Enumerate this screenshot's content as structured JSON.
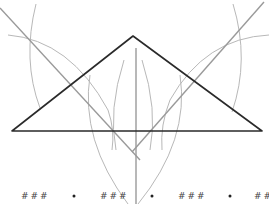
{
  "diagram": {
    "title": "",
    "triangle": {
      "vertices": [
        {
          "name": "A",
          "label": ""
        },
        {
          "name": "B",
          "label": ""
        },
        {
          "name": "C",
          "label": ""
        }
      ]
    },
    "colors": {
      "triangle": "#2a2a2a",
      "construction": "#b8b8b8",
      "bisector": "#9a9a9a",
      "marks": "#444444"
    },
    "bottom_marks": [
      {
        "type": "hash",
        "text": "###"
      },
      {
        "type": "dot",
        "text": "•"
      },
      {
        "type": "hash",
        "text": "###"
      },
      {
        "type": "dot",
        "text": "•"
      },
      {
        "type": "hash",
        "text": "###"
      },
      {
        "type": "dot",
        "text": "•"
      },
      {
        "type": "hash",
        "text": "##"
      }
    ]
  }
}
